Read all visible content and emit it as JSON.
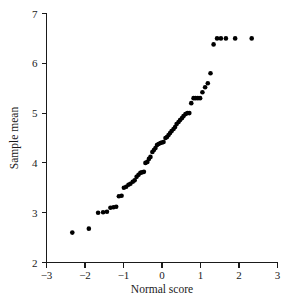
{
  "chart_data": {
    "type": "scatter",
    "title": "",
    "subtitle": "",
    "xlabel": "Normal score",
    "ylabel": "Sample mean",
    "xlim": [
      -3,
      3
    ],
    "ylim": [
      2,
      7
    ],
    "xticks": [
      -3,
      -2,
      -1,
      0,
      1,
      2,
      3
    ],
    "yticks": [
      2,
      3,
      4,
      5,
      6,
      7
    ],
    "xtick_labels": [
      "−3",
      "−2",
      "−1",
      "0",
      "1",
      "2",
      "3"
    ],
    "ytick_labels": [
      "2",
      "3",
      "4",
      "5",
      "6",
      "7"
    ],
    "grid": false,
    "legend": null,
    "marker": "filled-circle",
    "marker_color": "#000000",
    "marker_size_px": 4.6,
    "annotations": [],
    "x": [
      -2.33,
      -1.9,
      -1.66,
      -1.53,
      -1.43,
      -1.34,
      -1.26,
      -1.19,
      -1.12,
      -1.05,
      -0.99,
      -0.93,
      -0.87,
      -0.82,
      -0.76,
      -0.71,
      -0.66,
      -0.61,
      -0.56,
      -0.52,
      -0.47,
      -0.43,
      -0.38,
      -0.34,
      -0.3,
      -0.25,
      -0.21,
      -0.17,
      -0.13,
      -0.09,
      -0.04,
      0.0,
      0.04,
      0.09,
      0.13,
      0.17,
      0.21,
      0.25,
      0.3,
      0.34,
      0.38,
      0.43,
      0.47,
      0.52,
      0.56,
      0.61,
      0.66,
      0.71,
      0.76,
      0.82,
      0.87,
      0.93,
      0.99,
      1.05,
      1.12,
      1.19,
      1.26,
      1.34,
      1.43,
      1.53,
      1.66,
      1.9,
      2.33
    ],
    "y": [
      2.6,
      2.68,
      3.0,
      3.01,
      3.02,
      3.1,
      3.11,
      3.12,
      3.33,
      3.34,
      3.5,
      3.52,
      3.56,
      3.58,
      3.62,
      3.65,
      3.72,
      3.76,
      3.8,
      3.81,
      3.82,
      4.0,
      4.02,
      4.08,
      4.12,
      4.22,
      4.26,
      4.3,
      4.36,
      4.38,
      4.4,
      4.41,
      4.42,
      4.5,
      4.52,
      4.56,
      4.6,
      4.64,
      4.68,
      4.72,
      4.78,
      4.82,
      4.86,
      4.9,
      4.94,
      4.98,
      5.0,
      5.0,
      5.2,
      5.3,
      5.3,
      5.3,
      5.3,
      5.42,
      5.52,
      5.6,
      5.8,
      6.38,
      6.5,
      6.5,
      6.5,
      6.5,
      6.5
    ],
    "points": [
      [
        -2.33,
        2.6
      ],
      [
        -1.9,
        2.68
      ],
      [
        -1.66,
        3.0
      ],
      [
        -1.53,
        3.01
      ],
      [
        -1.43,
        3.02
      ],
      [
        -1.34,
        3.1
      ],
      [
        -1.26,
        3.11
      ],
      [
        -1.19,
        3.12
      ],
      [
        -1.12,
        3.33
      ],
      [
        -1.05,
        3.34
      ],
      [
        -0.99,
        3.5
      ],
      [
        -0.93,
        3.52
      ],
      [
        -0.87,
        3.56
      ],
      [
        -0.82,
        3.58
      ],
      [
        -0.76,
        3.62
      ],
      [
        -0.71,
        3.65
      ],
      [
        -0.66,
        3.72
      ],
      [
        -0.61,
        3.76
      ],
      [
        -0.56,
        3.8
      ],
      [
        -0.52,
        3.81
      ],
      [
        -0.47,
        3.82
      ],
      [
        -0.43,
        4.0
      ],
      [
        -0.38,
        4.02
      ],
      [
        -0.34,
        4.08
      ],
      [
        -0.3,
        4.12
      ],
      [
        -0.25,
        4.22
      ],
      [
        -0.21,
        4.26
      ],
      [
        -0.17,
        4.3
      ],
      [
        -0.13,
        4.36
      ],
      [
        -0.09,
        4.38
      ],
      [
        -0.04,
        4.4
      ],
      [
        0.0,
        4.41
      ],
      [
        0.04,
        4.42
      ],
      [
        0.09,
        4.5
      ],
      [
        0.13,
        4.52
      ],
      [
        0.17,
        4.56
      ],
      [
        0.21,
        4.6
      ],
      [
        0.25,
        4.64
      ],
      [
        0.3,
        4.68
      ],
      [
        0.34,
        4.72
      ],
      [
        0.38,
        4.78
      ],
      [
        0.43,
        4.82
      ],
      [
        0.47,
        4.86
      ],
      [
        0.52,
        4.9
      ],
      [
        0.56,
        4.94
      ],
      [
        0.61,
        4.98
      ],
      [
        0.66,
        5.0
      ],
      [
        0.71,
        5.0
      ],
      [
        0.76,
        5.2
      ],
      [
        0.82,
        5.3
      ],
      [
        0.87,
        5.3
      ],
      [
        0.93,
        5.3
      ],
      [
        0.99,
        5.3
      ],
      [
        1.05,
        5.42
      ],
      [
        1.12,
        5.52
      ],
      [
        1.19,
        5.6
      ],
      [
        1.26,
        5.8
      ],
      [
        1.34,
        6.38
      ],
      [
        1.43,
        6.5
      ],
      [
        1.53,
        6.5
      ],
      [
        1.66,
        6.5
      ],
      [
        1.9,
        6.5
      ],
      [
        2.33,
        6.5
      ]
    ],
    "n_points": 63
  }
}
